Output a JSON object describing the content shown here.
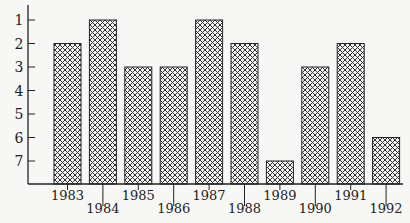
{
  "chart_data": {
    "type": "bar",
    "title": "",
    "xlabel": "",
    "ylabel": "",
    "y_inverted": true,
    "ylim": [
      8,
      1
    ],
    "yticks": [
      1,
      2,
      3,
      4,
      5,
      6,
      7
    ],
    "grid": false,
    "legend": null,
    "categories": [
      "1983",
      "1984",
      "1985",
      "1986",
      "1987",
      "1988",
      "1989",
      "1990",
      "1991",
      "1992"
    ],
    "values": [
      2,
      1,
      3,
      3,
      1,
      2,
      7,
      3,
      2,
      6
    ],
    "label_stagger": [
      false,
      true,
      false,
      true,
      false,
      true,
      false,
      true,
      false,
      true
    ],
    "bar_pattern": "crosshatch",
    "colors": {
      "axis": "#222222",
      "bar_stroke": "#222222",
      "hatch": "#333333",
      "background": "#f7f7f5"
    }
  }
}
